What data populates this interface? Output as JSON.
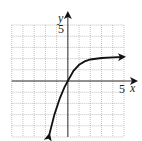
{
  "chart_data": {
    "type": "line",
    "title": "",
    "xlabel": "x",
    "ylabel": "y",
    "xlim": [
      -5,
      5
    ],
    "ylim": [
      -5,
      5
    ],
    "grid": true,
    "grid_step": 1,
    "tick_labels": {
      "x": [
        "5"
      ],
      "y": [
        "5"
      ]
    },
    "series": [
      {
        "name": "curve",
        "x": [
          -1.65,
          -1.2,
          -0.7,
          -0.3,
          0,
          0.5,
          1,
          1.5,
          2,
          3,
          4,
          5
        ],
        "y": [
          -4.8,
          -3.0,
          -1.5,
          -0.55,
          0,
          0.9,
          1.45,
          1.75,
          1.92,
          2.05,
          2.12,
          2.15
        ],
        "arrows": [
          "start",
          "end"
        ]
      }
    ]
  },
  "labels": {
    "x_axis": "x",
    "y_axis": "y",
    "x_tick": "5",
    "y_tick": "5"
  },
  "colors": {
    "grid": "#9a9a9a",
    "axis": "#333333",
    "curve": "#111111"
  }
}
